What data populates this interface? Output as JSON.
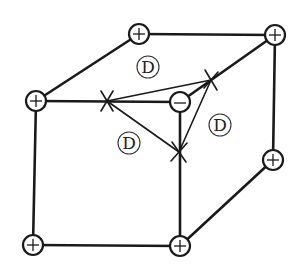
{
  "diagram": {
    "title": "",
    "colors": {
      "ink": "#1a1a1a",
      "background": "#ffffff"
    },
    "nodes": [
      {
        "id": "top-back-left",
        "sign": "+",
        "x": 139,
        "y": 34
      },
      {
        "id": "top-back-right",
        "sign": "+",
        "x": 275,
        "y": 35
      },
      {
        "id": "top-front-left",
        "sign": "+",
        "x": 36,
        "y": 101
      },
      {
        "id": "bottom-back-right",
        "sign": "+",
        "x": 273,
        "y": 160
      },
      {
        "id": "bottom-front-left",
        "sign": "+",
        "x": 33,
        "y": 245
      },
      {
        "id": "bottom-front-right",
        "sign": "+",
        "x": 180,
        "y": 246
      },
      {
        "id": "top-front-right",
        "sign": "−",
        "x": 180,
        "y": 102
      }
    ],
    "cross_markers": [
      {
        "id": "x-front-top-edge",
        "x": 107,
        "y": 101
      },
      {
        "id": "x-top-diagonal",
        "x": 211,
        "y": 80
      },
      {
        "id": "x-front-right-edge",
        "x": 179,
        "y": 152
      }
    ],
    "labels": [
      {
        "id": "d-top",
        "text": "D",
        "x": 148,
        "y": 67
      },
      {
        "id": "d-front",
        "text": "D",
        "x": 129,
        "y": 143
      },
      {
        "id": "d-right",
        "text": "D",
        "x": 220,
        "y": 125
      }
    ]
  }
}
